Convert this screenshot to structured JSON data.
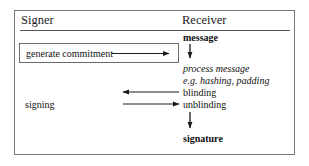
{
  "diagram": {
    "type": "protocol-flow",
    "title_columns": {
      "signer": "Signer",
      "receiver": "Receiver"
    },
    "signer_column": {
      "commitment_step": "generate commitment",
      "signing_step": "signing"
    },
    "receiver_column": {
      "message": "message",
      "process_message": "process message",
      "process_detail": "e.g. hashing, padding",
      "blinding": "blinding",
      "unblinding": "unblinding",
      "signature": "signature"
    },
    "arrows": [
      {
        "name": "commitment-to-receiver",
        "direction": "right",
        "from": "generate commitment",
        "to": "Receiver"
      },
      {
        "name": "message-to-process",
        "direction": "down",
        "from": "message",
        "to": "process message"
      },
      {
        "name": "blinding-to-signer",
        "direction": "left",
        "from": "blinding",
        "to": "Signer"
      },
      {
        "name": "unblinding-from-signer",
        "direction": "right",
        "from": "signing",
        "to": "unblinding"
      },
      {
        "name": "unblinding-to-signature",
        "direction": "down",
        "from": "unblinding",
        "to": "signature"
      }
    ],
    "colors": {
      "frame": "#7a7a7a",
      "rule": "#555555",
      "box": "#6b6b6b",
      "arrow": "#1a1a1a",
      "text": "#111111",
      "background": "#ffffff"
    }
  }
}
